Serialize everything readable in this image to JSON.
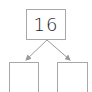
{
  "diagram": {
    "type": "number-bond",
    "whole": {
      "value": "16"
    },
    "parts": [
      {
        "value": ""
      },
      {
        "value": ""
      }
    ],
    "colors": {
      "border": "#a8a8a8",
      "arrow": "#9a9a9a",
      "text": "#222222"
    }
  }
}
